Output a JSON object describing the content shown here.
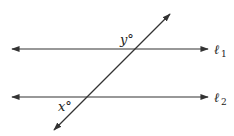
{
  "diagram": {
    "lines": [
      {
        "name": "l1",
        "label": "ℓ",
        "subscript": "1"
      },
      {
        "name": "l2",
        "label": "ℓ",
        "subscript": "2"
      }
    ],
    "angles": [
      {
        "name": "y",
        "label": "y°"
      },
      {
        "name": "x",
        "label": "x°"
      }
    ],
    "stroke_color": "#333333"
  }
}
